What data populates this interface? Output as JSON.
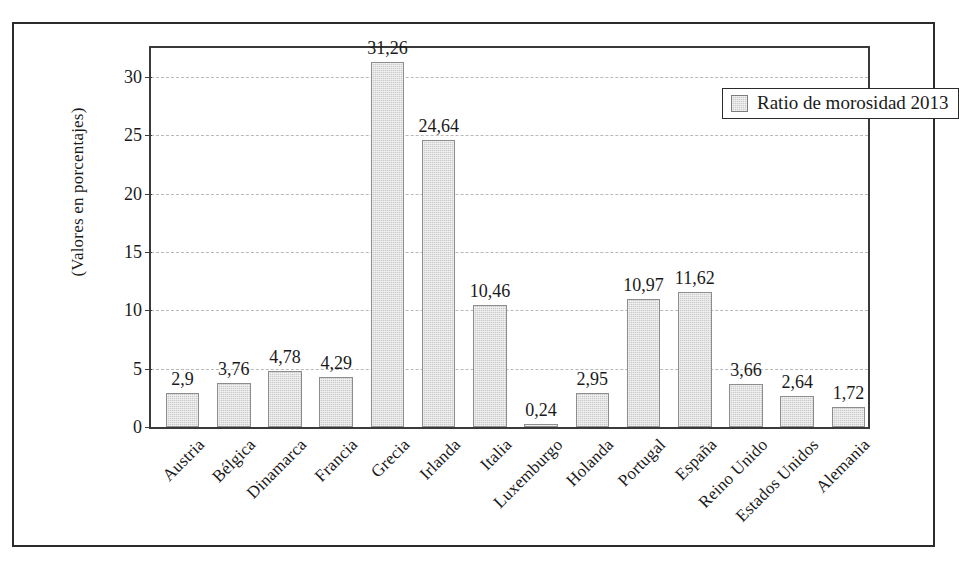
{
  "chart_data": {
    "type": "bar",
    "title": "",
    "xlabel": "",
    "ylabel": "(Valores en porcentajes)",
    "ylim": [
      0,
      32.5
    ],
    "grid": true,
    "legend_position": "top-right",
    "legend": [
      "Ratio de morosidad 2013"
    ],
    "ytick_labels": [
      "0",
      "5",
      "10",
      "15",
      "20",
      "25",
      "30"
    ],
    "ytick_values": [
      0,
      5,
      10,
      15,
      20,
      25,
      30
    ],
    "categories": [
      "Austria",
      "Bélgica",
      "Dinamarca",
      "Francia",
      "Grecia",
      "Irlanda",
      "Italia",
      "Luxemburgo",
      "Holanda",
      "Portugal",
      "España",
      "Reino Unido",
      "Estados Unidos",
      "Alemania"
    ],
    "values": [
      2.9,
      3.76,
      4.78,
      4.29,
      31.26,
      24.64,
      10.46,
      0.24,
      2.95,
      10.97,
      11.62,
      3.66,
      2.64,
      1.72
    ],
    "value_labels": [
      "2,9",
      "3,76",
      "4,78",
      "4,29",
      "31,26",
      "24,64",
      "10,46",
      "0,24",
      "2,95",
      "10,97",
      "11,62",
      "3,66",
      "2,64",
      "1,72"
    ],
    "series": [
      {
        "name": "Ratio de morosidad 2013",
        "values": [
          2.9,
          3.76,
          4.78,
          4.29,
          31.26,
          24.64,
          10.46,
          0.24,
          2.95,
          10.97,
          11.62,
          3.66,
          2.64,
          1.72
        ]
      }
    ]
  },
  "colors": {
    "bar_fill": "#cccccc",
    "bar_stroke": "#8d8d8d",
    "axis": "#3a3a3a",
    "grid": "#b9b9b9",
    "frame": "#2b2b2b",
    "text": "#1a1a1a",
    "background": "#ffffff"
  }
}
